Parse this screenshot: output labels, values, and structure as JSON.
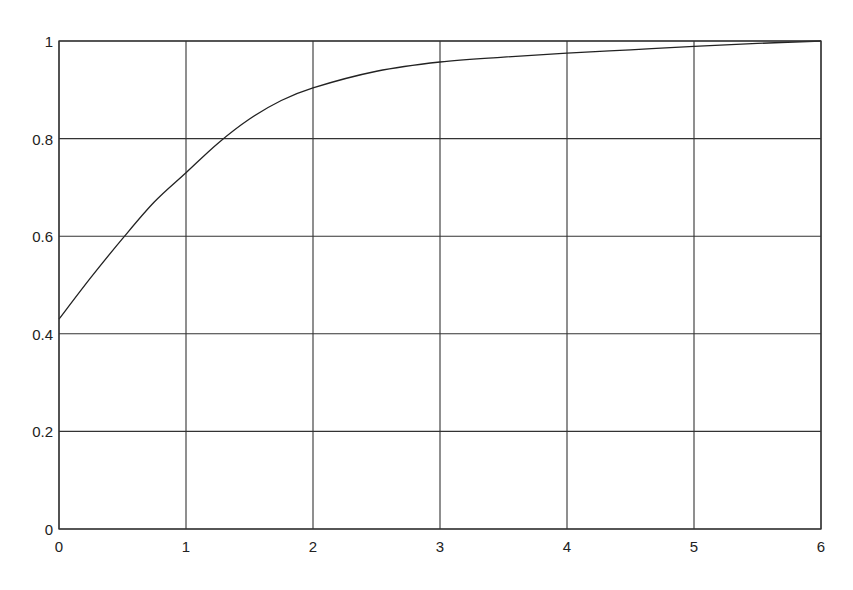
{
  "chart_data": {
    "type": "line",
    "title": "",
    "xlabel": "",
    "ylabel": "",
    "xlim": [
      0,
      6
    ],
    "ylim": [
      0,
      1
    ],
    "grid": true,
    "legend": null,
    "x_ticks": [
      "0",
      "1",
      "2",
      "3",
      "4",
      "5",
      "6"
    ],
    "y_ticks": [
      "0",
      "0.2",
      "0.4",
      "0.6",
      "0.8",
      "1"
    ],
    "series": [
      {
        "name": "curve",
        "color": "#222222",
        "x": [
          0,
          0.25,
          0.5,
          0.75,
          1,
          1.25,
          1.5,
          1.75,
          2,
          2.5,
          3,
          3.5,
          4,
          4.5,
          5,
          5.5,
          6
        ],
        "y": [
          0.43,
          0.515,
          0.595,
          0.67,
          0.73,
          0.79,
          0.84,
          0.878,
          0.904,
          0.938,
          0.957,
          0.967,
          0.975,
          0.982,
          0.989,
          0.995,
          1.0
        ]
      }
    ]
  }
}
